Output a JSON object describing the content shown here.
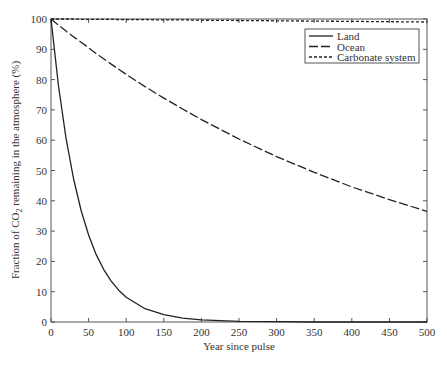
{
  "chart_data": {
    "type": "line",
    "title": "",
    "xlabel": "Year since pulse",
    "ylabel_prefix": "Fraction of CO",
    "ylabel_sub": "2",
    "ylabel_suffix": " remaining in the atmosphere (%)",
    "ylabel": "Fraction of CO2 remaining in the atmosphere (%)",
    "xlim": [
      0,
      500
    ],
    "ylim": [
      0,
      100
    ],
    "xticks": [
      0,
      50,
      100,
      150,
      200,
      250,
      300,
      350,
      400,
      450,
      500
    ],
    "yticks": [
      0,
      10,
      20,
      30,
      40,
      50,
      60,
      70,
      80,
      90,
      100
    ],
    "grid": false,
    "legend_position": "upper right",
    "x": [
      0,
      10,
      20,
      30,
      40,
      50,
      60,
      70,
      80,
      90,
      100,
      125,
      150,
      175,
      200,
      250,
      300,
      350,
      400,
      450,
      500
    ],
    "series": [
      {
        "name": "Land",
        "style": "solid",
        "values": [
          100,
          77.9,
          60.7,
          47.2,
          36.8,
          28.7,
          22.3,
          17.4,
          13.5,
          10.5,
          8.2,
          4.4,
          2.4,
          1.3,
          0.7,
          0.2,
          0.1,
          0,
          0,
          0,
          0
        ]
      },
      {
        "name": "Ocean",
        "style": "dashed",
        "values": [
          100,
          98.0,
          96.0,
          94.1,
          92.3,
          90.5,
          88.6,
          86.9,
          85.1,
          83.4,
          81.7,
          77.7,
          73.9,
          70.3,
          66.8,
          60.4,
          54.6,
          49.4,
          44.6,
          40.4,
          36.5
        ]
      },
      {
        "name": "Carbonate system",
        "style": "dotted",
        "values": [
          100,
          100,
          100,
          100,
          99.9,
          99.9,
          99.9,
          99.9,
          99.9,
          99.8,
          99.8,
          99.8,
          99.7,
          99.7,
          99.6,
          99.5,
          99.4,
          99.3,
          99.2,
          99.1,
          99.0
        ]
      }
    ]
  }
}
